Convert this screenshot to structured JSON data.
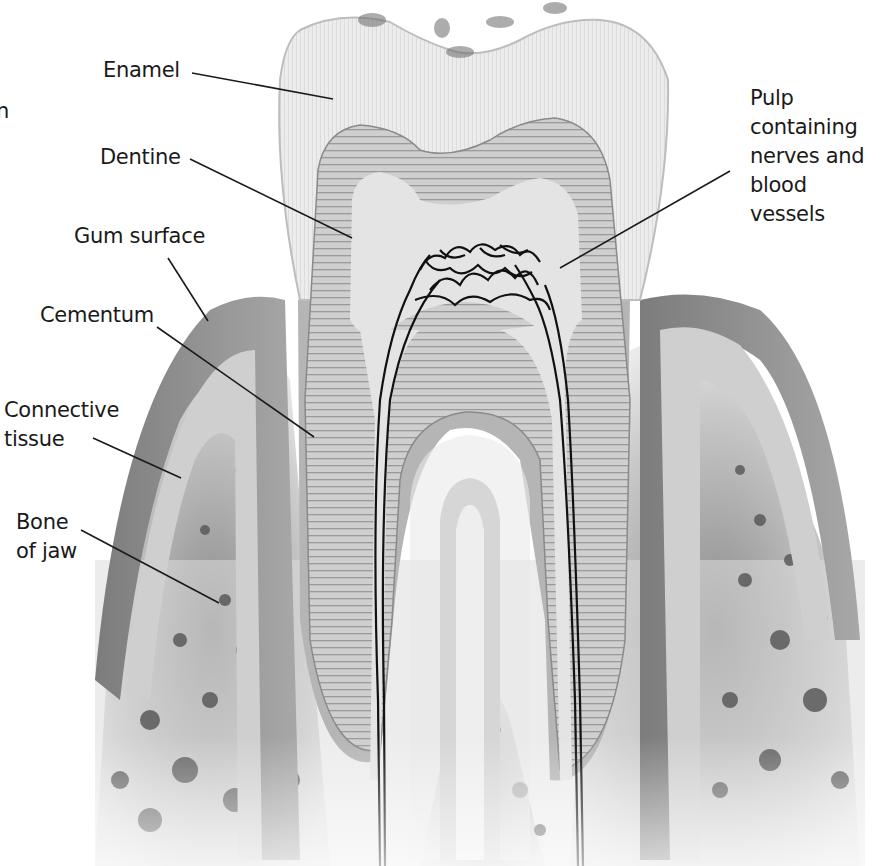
{
  "diagram": {
    "colors": {
      "background": "#ffffff",
      "enamel": "#f1f1f1",
      "dentine": "#c9c9c9",
      "pulp": "#e6e6e6",
      "gum": "#8c8c8c",
      "gum_inner": "#b8b8b8",
      "connective": "#d9d9d9",
      "bone": "#dcdcdc",
      "bone_spots": "#555555",
      "nerves": "#111111",
      "leader_lines": "#1a1a1a",
      "text": "#1a1a1a"
    },
    "partial_left_edge_text": "n",
    "labels": [
      {
        "id": "enamel",
        "text": "Enamel",
        "x": 103,
        "y": 56,
        "line": [
          192,
          73,
          333,
          99
        ]
      },
      {
        "id": "dentine",
        "text": "Dentine",
        "x": 100,
        "y": 143,
        "line": [
          190,
          159,
          352,
          238
        ]
      },
      {
        "id": "gum-surface",
        "text": "Gum surface",
        "x": 74,
        "y": 222,
        "line": [
          168,
          258,
          208,
          321
        ]
      },
      {
        "id": "cementum",
        "text": "Cementum",
        "x": 40,
        "y": 301,
        "line": [
          157,
          327,
          314,
          437
        ]
      },
      {
        "id": "connective-tissue",
        "text": "Connective\ntissue",
        "x": 4,
        "y": 396,
        "line": [
          93,
          438,
          181,
          478
        ]
      },
      {
        "id": "bone-of-jaw",
        "text": "Bone\nof jaw",
        "x": 16,
        "y": 508,
        "line": [
          81,
          530,
          219,
          603
        ]
      },
      {
        "id": "pulp",
        "text": "Pulp\ncontaining\nnerves and\nblood\nvessels",
        "x": 750,
        "y": 84,
        "line": [
          730,
          171,
          560,
          268
        ]
      }
    ]
  }
}
